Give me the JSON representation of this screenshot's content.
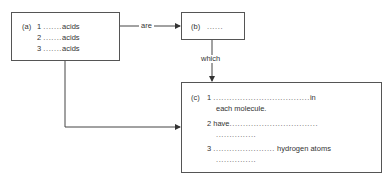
{
  "nodes": {
    "a": {
      "tag": "(a)",
      "items": [
        {
          "num": "1",
          "dots": ".......",
          "text": "acids"
        },
        {
          "num": "2",
          "dots": ".......",
          "text": "acids"
        },
        {
          "num": "3",
          "dots": ".......",
          "text": "acids"
        }
      ]
    },
    "b": {
      "tag": "(b)",
      "dots": "......"
    },
    "c": {
      "tag": "(c)",
      "items": [
        {
          "num": "1",
          "prefix": "",
          "dots": "....................................",
          "suffix": "in",
          "line2": "each molecule."
        },
        {
          "num": "2",
          "prefix": "have",
          "dots": ".................................",
          "suffix": "",
          "line2": "..............."
        },
        {
          "num": "3",
          "prefix": "",
          "dots": ".......................",
          "suffix": "hydrogen atoms",
          "line2": "..............."
        }
      ]
    }
  },
  "edges": [
    {
      "from": "a",
      "to": "b",
      "label": "are"
    },
    {
      "from": "b",
      "to": "c",
      "label": "which"
    },
    {
      "from": "a",
      "to": "c",
      "label": ""
    }
  ],
  "colors": {
    "line": "#444444",
    "text": "#333333"
  }
}
